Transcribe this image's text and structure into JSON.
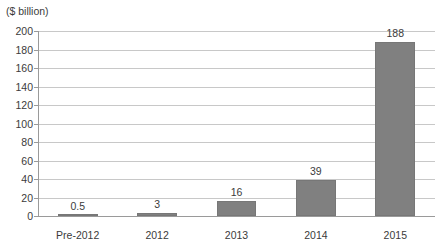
{
  "chart_data": {
    "type": "bar",
    "title": "",
    "subtitle": "",
    "xlabel": "",
    "ylabel": "($ billion)",
    "categories": [
      "Pre-2012",
      "2012",
      "2013",
      "2014",
      "2015"
    ],
    "values": [
      0.5,
      3,
      16,
      39,
      188
    ],
    "value_labels": [
      "0.5",
      "3",
      "16",
      "39",
      "188"
    ],
    "ylim": [
      0,
      200
    ],
    "ytick_step": 20,
    "yticks": [
      200,
      180,
      160,
      140,
      120,
      100,
      80,
      60,
      40,
      20,
      0
    ],
    "ytick_labels": [
      "200",
      "180",
      "160",
      "140",
      "120",
      "100",
      "80",
      "60",
      "40",
      "20",
      "0"
    ],
    "grid": "horizontal",
    "legend": "none",
    "series": [
      {
        "name": "",
        "values": [
          0.5,
          3,
          16,
          39,
          188
        ]
      }
    ],
    "colors": {
      "bar_fill": "#808080",
      "bar_edge": "#777777",
      "gridline": "#c8c8c8",
      "axis": "#9a9a9a",
      "text": "#3b3b3b",
      "background": "#ffffff"
    }
  }
}
